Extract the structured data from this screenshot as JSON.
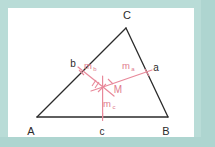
{
  "figure": {
    "frame_color": "#b9dcd7",
    "panel_color": "#ffffff",
    "triangle_color": "#2b2b2b",
    "bisector_color": "#e8899a",
    "label_dark_color": "#2b2b2b",
    "label_pink_color": "#e07a8c"
  },
  "vertices": [
    {
      "key": "A",
      "label": "A",
      "x": 37,
      "y": 117,
      "label_x": 31,
      "label_y": 132
    },
    {
      "key": "B",
      "label": "B",
      "x": 168,
      "y": 117,
      "label_x": 166,
      "label_y": 132
    },
    {
      "key": "C",
      "label": "C",
      "x": 126,
      "y": 28,
      "label_x": 127,
      "label_y": 16
    }
  ],
  "midpoints": [
    {
      "key": "a",
      "label": "a",
      "x": 147,
      "y": 72.5,
      "label_x": 156,
      "label_y": 68,
      "on_side": "BC"
    },
    {
      "key": "b",
      "label": "b",
      "x": 81.5,
      "y": 72.5,
      "label_x": 73,
      "label_y": 64,
      "on_side": "AC"
    },
    {
      "key": "c",
      "label": "c",
      "x": 102.5,
      "y": 117,
      "label_x": 102,
      "label_y": 132,
      "on_side": "AB"
    }
  ],
  "circumcenter": {
    "key": "M",
    "label": "M",
    "x": 103,
    "y": 87,
    "label_x": 117,
    "label_y": 90
  },
  "bisectors": [
    {
      "key": "m_a",
      "base": "m",
      "subscript": "a",
      "from_x": 103,
      "from_y": 87,
      "to_x": 152,
      "to_y": 70,
      "label_x": 127,
      "label_y": 66
    },
    {
      "key": "m_b",
      "base": "m",
      "subscript": "b",
      "from_x": 103,
      "from_y": 87,
      "to_x": 78,
      "to_y": 67,
      "label_x": 89,
      "label_y": 66
    },
    {
      "key": "m_c",
      "base": "m",
      "subscript": "c",
      "from_x": 103,
      "from_y": 87,
      "to_x": 102.5,
      "to_y": 118,
      "label_x": 107,
      "label_y": 104
    }
  ],
  "tick_marks": {
    "count": 4,
    "description": "short hatch strokes crossing the bisectors near M"
  }
}
